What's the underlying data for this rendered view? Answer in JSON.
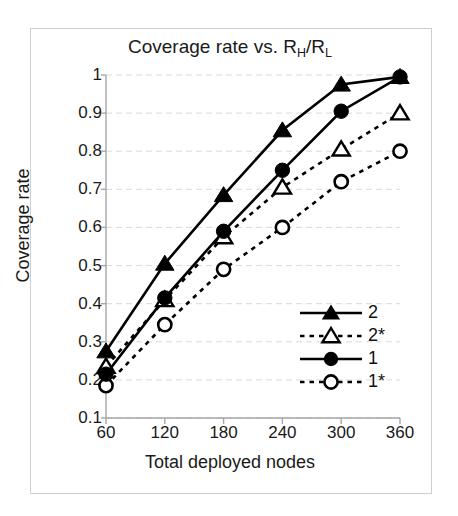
{
  "chart_data": {
    "type": "line",
    "title": "Coverage rate vs. RH/RL",
    "title_parts": {
      "prefix": "Coverage rate vs. R",
      "sub1": "H",
      "mid": "/R",
      "sub2": "L"
    },
    "xlabel": "Total deployed nodes",
    "ylabel": "Coverage rate",
    "categories": [
      60,
      120,
      180,
      240,
      300,
      360
    ],
    "x_tick_labels": [
      "60",
      "120",
      "180",
      "240",
      "300",
      "360"
    ],
    "y_tick_labels": [
      "0.1",
      "0.2",
      "0.3",
      "0.4",
      "0.5",
      "0.6",
      "0.7",
      "0.8",
      "0.9",
      "1"
    ],
    "y_tick_values": [
      0.1,
      0.2,
      0.3,
      0.4,
      0.5,
      0.6,
      0.7,
      0.8,
      0.9,
      1
    ],
    "ylim": [
      0.1,
      1.0
    ],
    "xlim": [
      60,
      360
    ],
    "grid": "horizontal-dashed",
    "legend_position": "lower-right",
    "series": [
      {
        "name": "2",
        "marker": "filled-triangle",
        "line_style": "solid",
        "color": "#000000",
        "values": [
          0.275,
          0.505,
          0.685,
          0.855,
          0.975,
          0.995
        ]
      },
      {
        "name": "2*",
        "marker": "open-triangle",
        "line_style": "dotted",
        "color": "#000000",
        "values": [
          0.235,
          0.41,
          0.575,
          0.705,
          0.805,
          0.9
        ]
      },
      {
        "name": "1",
        "marker": "filled-circle",
        "line_style": "solid",
        "color": "#000000",
        "values": [
          0.215,
          0.415,
          0.59,
          0.75,
          0.905,
          0.995
        ]
      },
      {
        "name": "1*",
        "marker": "open-circle",
        "line_style": "dotted",
        "color": "#000000",
        "values": [
          0.185,
          0.345,
          0.49,
          0.6,
          0.72,
          0.8
        ]
      }
    ]
  },
  "colors": {
    "frame": "#cfcfcf",
    "axis": "#a6a6a6",
    "grid": "#d9d9d9",
    "data": "#000000",
    "text": "#1a1a1a",
    "background": "#ffffff"
  }
}
